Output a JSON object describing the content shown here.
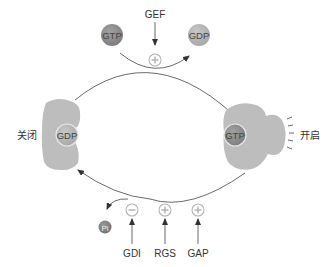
{
  "diagram": {
    "top": {
      "regulator": "GEF",
      "regulator_effect": "+",
      "incoming": "GTP",
      "outgoing": "GDP"
    },
    "left_state": {
      "label": "关闭",
      "bound_nucleotide": "GDP"
    },
    "right_state": {
      "label": "开启",
      "bound_nucleotide": "GTP"
    },
    "bottom": {
      "released": "Pi",
      "regulators": [
        {
          "label": "GDI",
          "effect": "−"
        },
        {
          "label": "RGS",
          "effect": "+"
        },
        {
          "label": "GAP",
          "effect": "+"
        }
      ]
    },
    "colors": {
      "protein": "#bdbdbd",
      "gtp": "#8a8a8a",
      "gdp": "#b0b0b0",
      "pi": "#7a7a7a",
      "line": "#444444",
      "symbol_ring": "#b5b5b5"
    }
  }
}
